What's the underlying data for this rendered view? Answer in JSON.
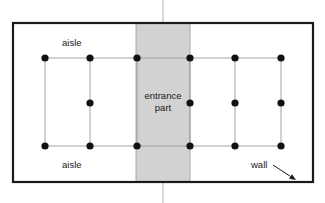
{
  "diagram": {
    "type": "floor-plan-schematic",
    "canvas": {
      "width": 325,
      "height": 203
    },
    "colors": {
      "wall_stroke": "#1a1a1a",
      "entrance_fill": "#d2d2d2",
      "entrance_stroke": "#9a9a9a",
      "grid_line": "#9a9a9a",
      "node_fill": "#111111",
      "center_line": "#b0b0b0",
      "background": "#ffffff",
      "label_color": "#1a1a1a"
    },
    "wall": {
      "label": "wall",
      "x": 13,
      "y": 23,
      "width": 300,
      "height": 159,
      "stroke_width": 2.2
    },
    "entrance": {
      "label_line1": "entrance",
      "label_line2": "part",
      "x": 136,
      "width": 54,
      "center_x": 163
    },
    "center_axis": {
      "x": 163,
      "top_segment": {
        "y1": 0,
        "y2": 23
      },
      "bottom_segment": {
        "y1": 182,
        "y2": 203
      }
    },
    "aisles": [
      {
        "label": "aisle",
        "x": 62,
        "y": 46,
        "position": "top"
      },
      {
        "label": "aisle",
        "x": 62,
        "y": 168,
        "position": "bottom"
      }
    ],
    "wall_callout": {
      "label": "wall",
      "text_x": 251,
      "text_y": 168,
      "arrow_from_x": 273,
      "arrow_from_y": 165,
      "arrow_to_x": 296,
      "arrow_to_y": 180
    },
    "grid": {
      "columns": [
        45,
        90,
        137,
        190,
        235,
        281
      ],
      "rows": [
        58,
        103,
        146
      ],
      "node_radius": 3.6
    },
    "nodes": [
      {
        "row": 0,
        "col": 0,
        "x": 45,
        "y": 58
      },
      {
        "row": 0,
        "col": 1,
        "x": 90,
        "y": 58
      },
      {
        "row": 0,
        "col": 2,
        "x": 137,
        "y": 58
      },
      {
        "row": 0,
        "col": 3,
        "x": 190,
        "y": 58
      },
      {
        "row": 0,
        "col": 4,
        "x": 235,
        "y": 58
      },
      {
        "row": 0,
        "col": 5,
        "x": 281,
        "y": 58
      },
      {
        "row": 1,
        "col": 1,
        "x": 90,
        "y": 103
      },
      {
        "row": 1,
        "col": 3,
        "x": 190,
        "y": 103
      },
      {
        "row": 1,
        "col": 4,
        "x": 235,
        "y": 103
      },
      {
        "row": 1,
        "col": 5,
        "x": 281,
        "y": 103
      },
      {
        "row": 2,
        "col": 0,
        "x": 45,
        "y": 146
      },
      {
        "row": 2,
        "col": 1,
        "x": 90,
        "y": 146
      },
      {
        "row": 2,
        "col": 2,
        "x": 137,
        "y": 146
      },
      {
        "row": 2,
        "col": 3,
        "x": 190,
        "y": 146
      },
      {
        "row": 2,
        "col": 4,
        "x": 235,
        "y": 146
      },
      {
        "row": 2,
        "col": 5,
        "x": 281,
        "y": 146
      }
    ],
    "edges_horizontal": [
      {
        "x1": 45,
        "x2": 281,
        "y": 58
      },
      {
        "x1": 45,
        "x2": 281,
        "y": 146
      }
    ],
    "edges_vertical": [
      {
        "x": 45,
        "y1": 58,
        "y2": 146
      },
      {
        "x": 90,
        "y1": 58,
        "y2": 146
      },
      {
        "x": 137,
        "y1": 58,
        "y2": 146
      },
      {
        "x": 190,
        "y1": 58,
        "y2": 146
      },
      {
        "x": 235,
        "y1": 58,
        "y2": 146
      },
      {
        "x": 281,
        "y1": 58,
        "y2": 146
      }
    ]
  }
}
